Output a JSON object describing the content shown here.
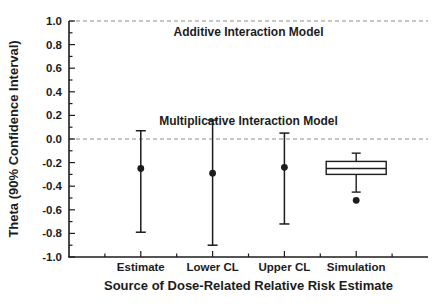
{
  "figure": {
    "background": "#ffffff",
    "ink_color": "#1c1c1c",
    "dashed_line_color": "#8c8c8c"
  },
  "chart_data": {
    "type": "scatter",
    "subtype": "point-estimates-with-error-bars-and-boxplot",
    "title": "",
    "xlabel": "Source of Dose-Related Relative Risk Estimate",
    "ylabel": "Theta (90% Confidence Interval)",
    "ylim": [
      -1.0,
      1.0
    ],
    "y_major_tick_step": 0.2,
    "y_minor_tick_step": 0.1,
    "y_tick_labels": [
      "1.0",
      "0.8",
      "0.6",
      "0.4",
      "0.2",
      "0.0",
      "-0.2",
      "-0.4",
      "-0.6",
      "-0.8",
      "-1.0"
    ],
    "categories": [
      "Estimate",
      "Lower CL",
      "Upper CL",
      "Simulation"
    ],
    "grid": "off",
    "legend": "none",
    "reference_lines": [
      {
        "y": 1.0,
        "label": "Additive Interaction Model",
        "style": "dashed",
        "label_position": "below-line"
      },
      {
        "y": 0.0,
        "label": "Multiplicative Interaction Model",
        "style": "dashed",
        "label_position": "above-line"
      }
    ],
    "series": [
      {
        "name": "point-estimate-with-90pct-CI",
        "marker": "filled-circle",
        "points": [
          {
            "category": "Estimate",
            "y": -0.25,
            "ci_low": -0.79,
            "ci_high": 0.07
          },
          {
            "category": "Lower CL",
            "y": -0.29,
            "ci_low": -0.9,
            "ci_high": 0.16
          },
          {
            "category": "Upper CL",
            "y": -0.24,
            "ci_low": -0.72,
            "ci_high": 0.05
          }
        ]
      },
      {
        "name": "simulation-distribution",
        "marker": "boxplot",
        "boxplot": {
          "category": "Simulation",
          "whisker_high": -0.12,
          "q3": -0.19,
          "median": -0.25,
          "q1": -0.3,
          "whisker_low": -0.45,
          "outliers": [
            -0.52
          ]
        }
      }
    ]
  }
}
